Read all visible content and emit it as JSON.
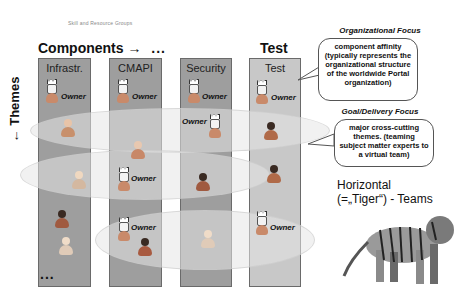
{
  "subtitle": "Skill and Resource Groups",
  "components_label": "Components →",
  "components_ellipsis": "...",
  "themes_label": "← Themes",
  "bottom_ellipsis": "...",
  "test_heading": "Test",
  "columns": [
    {
      "title": "Infrastr."
    },
    {
      "title": "CMAPI"
    },
    {
      "title": "Security"
    },
    {
      "title": "Test"
    }
  ],
  "owner_label": "Owner",
  "org_focus": {
    "title": "Organizational Focus",
    "text": "component affinity (typically represents the organizational structure of the worldwide Portal organization)"
  },
  "goal_focus": {
    "title": "Goal/Delivery Focus",
    "text": "major cross-cutting themes. (teaming subject matter experts to a virtual team)"
  },
  "horizontal": {
    "line1": "Horizontal",
    "line2": "(=„Tiger“) - Teams"
  },
  "colors": {
    "column": "#9e9e9e",
    "test_column": "#c8c8c8",
    "band": "#e6e6e6"
  }
}
